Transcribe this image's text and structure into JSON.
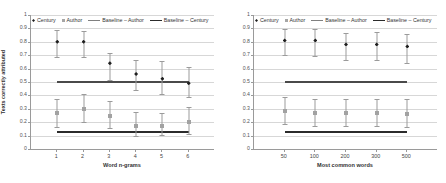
{
  "figure": {
    "yaxis_title": "Texts correctly attributed",
    "ytick_labels": [
      "0",
      "0.1",
      "0.2",
      "0.3",
      "0.4",
      "0.5",
      "0.6",
      "0.7",
      "0.8",
      "0.9",
      "1"
    ],
    "legend": [
      {
        "label": "Century",
        "marker": "diamond-marker-icon",
        "color": "#1f1f1f"
      },
      {
        "label": "Author",
        "marker": "square-marker-icon",
        "color": "#a6a6a6"
      },
      {
        "label": "Baseline – Author",
        "marker": "line-marker-icon",
        "color": "#808080"
      },
      {
        "label": "Baseline – Century",
        "marker": "line-marker-icon",
        "color": "#2b2b2b"
      }
    ]
  },
  "chart_data": [
    {
      "type": "scatter",
      "panel": "left",
      "title": "",
      "xlabel": "Word n-grams",
      "ylabel": "Texts correctly attributed",
      "categories": [
        "1",
        "2",
        "3",
        "4",
        "5",
        "6"
      ],
      "ylim": [
        0,
        1
      ],
      "ytick_step": 0.1,
      "grid": true,
      "legend_position": "top",
      "series": [
        {
          "name": "Century",
          "color": "#1f1f1f",
          "marker": "diamond",
          "values": [
            0.8,
            0.8,
            0.64,
            0.56,
            0.525,
            0.49
          ],
          "err_low": [
            0.685,
            0.685,
            0.515,
            0.44,
            0.41,
            0.385
          ],
          "err_high": [
            0.885,
            0.88,
            0.715,
            0.665,
            0.655,
            0.615
          ]
        },
        {
          "name": "Author",
          "color": "#a2a2a2",
          "marker": "square",
          "values": [
            0.265,
            0.295,
            0.25,
            0.17,
            0.17,
            0.2
          ],
          "err_low": [
            0.165,
            0.2,
            0.16,
            0.1,
            0.105,
            0.115
          ],
          "err_high": [
            0.375,
            0.41,
            0.36,
            0.275,
            0.265,
            0.31
          ]
        }
      ],
      "baselines": [
        {
          "name": "Baseline – Century",
          "value": 0.5,
          "color": "#4a4a4a"
        },
        {
          "name": "Baseline – Author",
          "value": 0.125,
          "color": "#2b2b2b"
        }
      ]
    },
    {
      "type": "scatter",
      "panel": "right",
      "title": "",
      "xlabel": "Most common words",
      "ylabel": "Texts correctly attributed",
      "categories": [
        "50",
        "100",
        "200",
        "300",
        "500"
      ],
      "ylim": [
        0,
        1
      ],
      "ytick_step": 0.1,
      "grid": true,
      "legend_position": "top",
      "series": [
        {
          "name": "Century",
          "color": "#1f1f1f",
          "marker": "diamond",
          "values": [
            0.81,
            0.81,
            0.78,
            0.78,
            0.765
          ],
          "err_low": [
            0.705,
            0.695,
            0.665,
            0.665,
            0.645
          ],
          "err_high": [
            0.895,
            0.895,
            0.865,
            0.87,
            0.855
          ]
        },
        {
          "name": "Author",
          "color": "#a2a2a2",
          "marker": "square",
          "values": [
            0.285,
            0.265,
            0.265,
            0.265,
            0.26
          ],
          "err_low": [
            0.185,
            0.175,
            0.175,
            0.17,
            0.165
          ],
          "err_high": [
            0.39,
            0.375,
            0.375,
            0.375,
            0.37
          ]
        }
      ],
      "baselines": [
        {
          "name": "Baseline – Century",
          "value": 0.5,
          "color": "#4a4a4a"
        },
        {
          "name": "Baseline – Author",
          "value": 0.125,
          "color": "#2b2b2b"
        }
      ]
    }
  ]
}
